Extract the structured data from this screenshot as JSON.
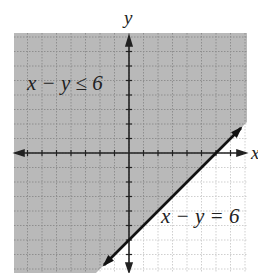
{
  "chart_data": {
    "type": "area",
    "title": "",
    "xlabel": "x",
    "ylabel": "y",
    "xlim": [
      -8,
      8
    ],
    "ylim": [
      -8,
      8
    ],
    "grid": true,
    "tick_step": 1,
    "boundary_line": {
      "equation": "x - y = 6",
      "slope": 1,
      "y_intercept": -6,
      "x_intercept": 6,
      "style": "solid",
      "points": [
        [
          -2,
          -8
        ],
        [
          8,
          2
        ]
      ]
    },
    "inequality": "x - y ≤ 6",
    "shaded_region": "above-left of line (y >= x - 6)",
    "annotations": [
      {
        "text": "x − y ≤ 6",
        "x": -7,
        "y": 4.5
      },
      {
        "text": "x − y = 6",
        "x": 2.2,
        "y": -3.8
      }
    ],
    "colors": {
      "shade": "#b9b9b9",
      "grid_shaded": "#8e8e8e",
      "grid_unshaded": "#cfcfcf",
      "axes": "#222222",
      "line": "#111111"
    }
  },
  "labels": {
    "x_axis": "x",
    "y_axis": "y",
    "inequality": "x − y ≤ 6",
    "equation": "x − y = 6"
  }
}
